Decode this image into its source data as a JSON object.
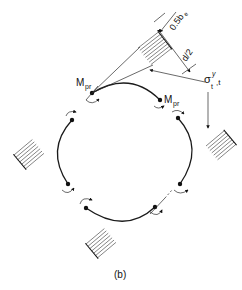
{
  "figure": {
    "caption": "(b)",
    "labels": {
      "moment_left": "M",
      "moment_left_sub": "pr",
      "moment_right": "M",
      "moment_right_sub": "pr",
      "dim_top": "0.5b",
      "dim_top_sub": "e",
      "dim_mid": "d/2",
      "stress": "σ",
      "stress_sup": "y",
      "stress_sub": "t",
      "stress_tail": ",t"
    },
    "elements": {
      "arc_segments": 4,
      "hinge_points": 8,
      "stress_blocks": 4
    },
    "colors": {
      "ink": "#1a1a1a",
      "background": "#ffffff"
    }
  }
}
